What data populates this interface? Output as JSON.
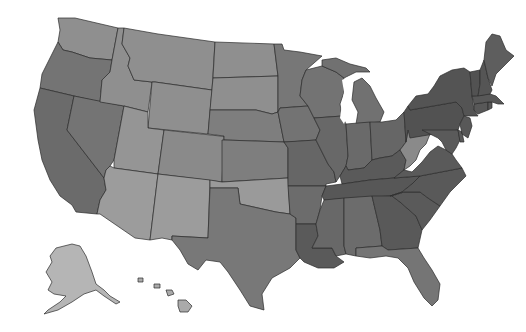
{
  "map": {
    "type": "choropleth",
    "region": "United States",
    "palette": "grayscale",
    "background": "#ffffff",
    "border_color": "#2b2b2b",
    "shade_levels": {
      "lightest": "#b5b5b5",
      "light": "#9a9a9a",
      "light_mid": "#8c8c8c",
      "medium": "#7c7c7c",
      "medium_dark": "#6b6b6b",
      "dark": "#585858",
      "darkest": "#4e4e4e"
    },
    "states": [
      {
        "id": "WA",
        "name": "Washington",
        "level": "light",
        "fill": "#8f8f8f"
      },
      {
        "id": "OR",
        "name": "Oregon",
        "level": "medium",
        "fill": "#747474"
      },
      {
        "id": "CA",
        "name": "California",
        "level": "medium_dark",
        "fill": "#6b6b6b"
      },
      {
        "id": "NV",
        "name": "Nevada",
        "level": "medium",
        "fill": "#747474"
      },
      {
        "id": "ID",
        "name": "Idaho",
        "level": "light",
        "fill": "#8f8f8f"
      },
      {
        "id": "MT",
        "name": "Montana",
        "level": "light",
        "fill": "#8f8f8f"
      },
      {
        "id": "WY",
        "name": "Wyoming",
        "level": "light",
        "fill": "#8f8f8f"
      },
      {
        "id": "UT",
        "name": "Utah",
        "level": "light",
        "fill": "#959595"
      },
      {
        "id": "AZ",
        "name": "Arizona",
        "level": "light",
        "fill": "#9c9c9c"
      },
      {
        "id": "CO",
        "name": "Colorado",
        "level": "light",
        "fill": "#8a8a8a"
      },
      {
        "id": "NM",
        "name": "New Mexico",
        "level": "light",
        "fill": "#9c9c9c"
      },
      {
        "id": "ND",
        "name": "North Dakota",
        "level": "light",
        "fill": "#8f8f8f"
      },
      {
        "id": "SD",
        "name": "South Dakota",
        "level": "light",
        "fill": "#8f8f8f"
      },
      {
        "id": "NE",
        "name": "Nebraska",
        "level": "medium",
        "fill": "#7e7e7e"
      },
      {
        "id": "KS",
        "name": "Kansas",
        "level": "medium",
        "fill": "#7e7e7e"
      },
      {
        "id": "OK",
        "name": "Oklahoma",
        "level": "light",
        "fill": "#9a9a9a"
      },
      {
        "id": "TX",
        "name": "Texas",
        "level": "medium",
        "fill": "#787878"
      },
      {
        "id": "MN",
        "name": "Minnesota",
        "level": "medium",
        "fill": "#777777"
      },
      {
        "id": "IA",
        "name": "Iowa",
        "level": "medium",
        "fill": "#737373"
      },
      {
        "id": "MO",
        "name": "Missouri",
        "level": "medium_dark",
        "fill": "#666666"
      },
      {
        "id": "AR",
        "name": "Arkansas",
        "level": "medium_dark",
        "fill": "#6c6c6c"
      },
      {
        "id": "LA",
        "name": "Louisiana",
        "level": "dark",
        "fill": "#5a5a5a"
      },
      {
        "id": "WI",
        "name": "Wisconsin",
        "level": "medium",
        "fill": "#737373"
      },
      {
        "id": "IL",
        "name": "Illinois",
        "level": "medium_dark",
        "fill": "#686868"
      },
      {
        "id": "MI",
        "name": "Michigan",
        "level": "medium",
        "fill": "#717171"
      },
      {
        "id": "IN",
        "name": "Indiana",
        "level": "medium_dark",
        "fill": "#6a6a6a"
      },
      {
        "id": "OH",
        "name": "Ohio",
        "level": "medium_dark",
        "fill": "#666666"
      },
      {
        "id": "KY",
        "name": "Kentucky",
        "level": "dark",
        "fill": "#5a5a5a"
      },
      {
        "id": "TN",
        "name": "Tennessee",
        "level": "dark",
        "fill": "#575757"
      },
      {
        "id": "MS",
        "name": "Mississippi",
        "level": "medium_dark",
        "fill": "#686868"
      },
      {
        "id": "AL",
        "name": "Alabama",
        "level": "medium_dark",
        "fill": "#6c6c6c"
      },
      {
        "id": "GA",
        "name": "Georgia",
        "level": "dark",
        "fill": "#595959"
      },
      {
        "id": "FL",
        "name": "Florida",
        "level": "medium",
        "fill": "#757575"
      },
      {
        "id": "SC",
        "name": "South Carolina",
        "level": "dark",
        "fill": "#5a5a5a"
      },
      {
        "id": "NC",
        "name": "North Carolina",
        "level": "dark",
        "fill": "#595959"
      },
      {
        "id": "VA",
        "name": "Virginia",
        "level": "dark",
        "fill": "#5a5a5a"
      },
      {
        "id": "WV",
        "name": "West Virginia",
        "level": "light_mid",
        "fill": "#8a8a8a"
      },
      {
        "id": "PA",
        "name": "Pennsylvania",
        "level": "darkest",
        "fill": "#525252"
      },
      {
        "id": "NY",
        "name": "New York",
        "level": "darkest",
        "fill": "#545454"
      },
      {
        "id": "MD",
        "name": "Maryland",
        "level": "dark",
        "fill": "#5a5a5a"
      },
      {
        "id": "DE",
        "name": "Delaware",
        "level": "dark",
        "fill": "#5a5a5a"
      },
      {
        "id": "NJ",
        "name": "New Jersey",
        "level": "dark",
        "fill": "#585858"
      },
      {
        "id": "CT",
        "name": "Connecticut",
        "level": "dark",
        "fill": "#585858"
      },
      {
        "id": "RI",
        "name": "Rhode Island",
        "level": "dark",
        "fill": "#585858"
      },
      {
        "id": "MA",
        "name": "Massachusetts",
        "level": "dark",
        "fill": "#585858"
      },
      {
        "id": "VT",
        "name": "Vermont",
        "level": "darkest",
        "fill": "#525252"
      },
      {
        "id": "NH",
        "name": "New Hampshire",
        "level": "darkest",
        "fill": "#555555"
      },
      {
        "id": "ME",
        "name": "Maine",
        "level": "dark",
        "fill": "#5e5e5e"
      },
      {
        "id": "AK",
        "name": "Alaska",
        "level": "lightest",
        "fill": "#b5b5b5"
      },
      {
        "id": "HI",
        "name": "Hawaii",
        "level": "lightest",
        "fill": "#aaaaaa"
      }
    ]
  }
}
